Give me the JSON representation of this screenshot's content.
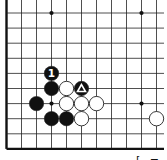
{
  "diagram": {
    "type": "go-board-fragment",
    "grid": {
      "columns": 11,
      "rows": 10,
      "origin_x": 6.5,
      "origin_y": 13,
      "spacing_x": 15,
      "spacing_y": 15.1,
      "edges": {
        "left": true,
        "bottom": true,
        "top": false,
        "right": false
      },
      "line_color": "#222222",
      "edge_color": "#111111"
    },
    "hoshi": [
      {
        "col": 3,
        "row": 0
      },
      {
        "col": 9,
        "row": 0
      },
      {
        "col": 3,
        "row": 6
      },
      {
        "col": 9,
        "row": 6
      }
    ],
    "stones": [
      {
        "color": "black",
        "col": 3,
        "row": 4,
        "label": "1"
      },
      {
        "color": "black",
        "col": 3,
        "row": 5
      },
      {
        "color": "white",
        "col": 4,
        "row": 5
      },
      {
        "color": "black",
        "col": 5,
        "row": 5,
        "mark": "triangle"
      },
      {
        "color": "black",
        "col": 2,
        "row": 6
      },
      {
        "color": "white",
        "col": 4,
        "row": 6
      },
      {
        "color": "white",
        "col": 5,
        "row": 6
      },
      {
        "color": "white",
        "col": 6,
        "row": 6
      },
      {
        "color": "black",
        "col": 3,
        "row": 7
      },
      {
        "color": "black",
        "col": 4,
        "row": 7
      },
      {
        "color": "white",
        "col": 5,
        "row": 7
      },
      {
        "color": "white",
        "col": 10,
        "row": 7
      }
    ],
    "move_label": "1",
    "caption_fragment": "[ ="
  },
  "colors": {
    "black_stone": "#111111",
    "white_stone": "#ffffff",
    "stone_outline": "#222222",
    "background": "#ffffff"
  }
}
